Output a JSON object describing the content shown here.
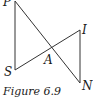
{
  "figure": {
    "caption": "Figure 6.9",
    "points": {
      "P": {
        "label": "P",
        "x": 15,
        "y": 1
      },
      "S": {
        "label": "S",
        "x": 15,
        "y": 70
      },
      "A": {
        "label": "A",
        "x": 50,
        "y": 50
      },
      "I": {
        "label": "I",
        "x": 80,
        "y": 30
      },
      "N": {
        "label": "N",
        "x": 80,
        "y": 83
      }
    },
    "segments": [
      [
        "P",
        "S"
      ],
      [
        "P",
        "N"
      ],
      [
        "S",
        "I"
      ],
      [
        "I",
        "N"
      ]
    ],
    "stroke_color": "#333333"
  }
}
